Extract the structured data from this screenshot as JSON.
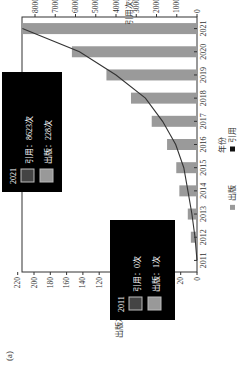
{
  "panel_label": "(a)",
  "chart_data": {
    "type": "bar+line",
    "orientation": "rotated 90deg counter-clockwise",
    "categories": [
      "2011",
      "2012",
      "2013",
      "2014",
      "2015",
      "2016",
      "2017",
      "2018",
      "2019",
      "2020",
      "2021"
    ],
    "series": [
      {
        "name": "出版",
        "type": "bar",
        "axis": "left",
        "color": "#9a9a9a",
        "values": [
          1,
          8,
          12,
          23,
          27,
          39,
          59,
          86,
          118,
          163,
          228
        ]
      },
      {
        "name": "引用",
        "type": "line",
        "axis": "right",
        "color": "#333333",
        "values": [
          0,
          100,
          250,
          450,
          650,
          1050,
          1700,
          2550,
          4000,
          5800,
          8623
        ]
      }
    ],
    "xlabel": "年份",
    "ylabel_left": "出版次数/次",
    "ylabel_right": "引用次数/次",
    "ylim_left": [
      0,
      240
    ],
    "ylim_right": [
      0,
      8800
    ],
    "left_ticks": [
      0,
      20,
      40,
      60,
      80,
      100,
      120,
      140,
      160,
      180,
      200,
      220
    ],
    "right_ticks": [
      0,
      1000,
      2000,
      3000,
      4000,
      5000,
      6000,
      7000,
      8000
    ],
    "legend": [
      "出版",
      "引用"
    ],
    "tooltips": [
      {
        "year": "2011",
        "cite_label": "引用：0次",
        "pub_label": "出版：1次"
      },
      {
        "year": "2021",
        "cite_label": "引用：8623次",
        "pub_label": "出版：228次"
      }
    ]
  }
}
